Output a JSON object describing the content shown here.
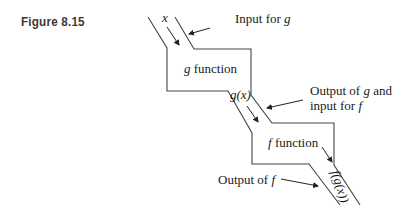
{
  "figure": {
    "label": "Figure 8.15"
  },
  "diagram": {
    "nodes": {
      "g_box": {
        "var": "g",
        "label": " function"
      },
      "f_box": {
        "var": "f",
        "label": " function"
      }
    },
    "flow_labels": {
      "input": "x",
      "g_output": "g(x)",
      "f_output": "f(g(x))"
    },
    "annotations": {
      "input_for_g": {
        "text": "Input for ",
        "var": "g"
      },
      "output_g_line1": {
        "text": "Output of ",
        "var": "g",
        "tail": " and"
      },
      "output_g_line2": {
        "text": "input for ",
        "var": "f"
      },
      "output_of_f": {
        "text": "Output of ",
        "var": "f"
      }
    }
  }
}
